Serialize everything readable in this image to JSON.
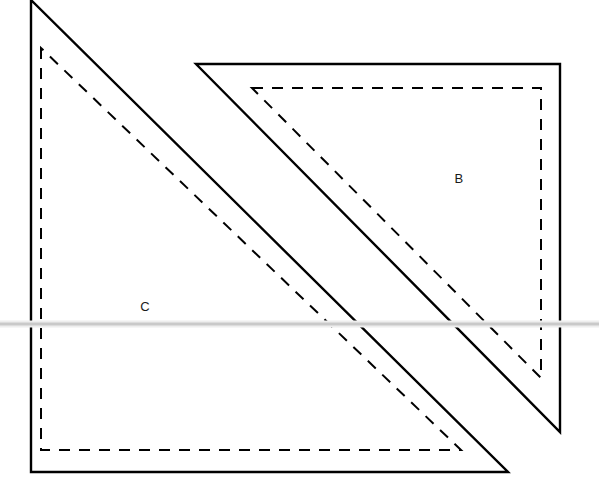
{
  "canvas": {
    "width": 599,
    "height": 478,
    "background": "#ffffff"
  },
  "style": {
    "solid_stroke": "#000000",
    "solid_width": 2.4,
    "dashed_stroke": "#000000",
    "dashed_width": 2.0,
    "dash_pattern": "11 9",
    "guide_color": "#c9c9c9",
    "guide_halo_color": "#eeeeee",
    "label_color": "#1a1a1a"
  },
  "shapes": [
    {
      "id": "shape-c",
      "label": "C",
      "label_x": 145,
      "label_y": 308,
      "solid_points": "31,0 31,472 508,472",
      "dashed_points": "41,48 41,450 461,450"
    },
    {
      "id": "shape-b",
      "label": "B",
      "label_x": 459,
      "label_y": 180,
      "solid_points": "196,64 560,64 560,432",
      "dashed_points": "252,88 541,88 541,378"
    }
  ],
  "guide_line": {
    "name": "horizontal-guide",
    "x1": 0,
    "y1": 324,
    "x2": 599,
    "y2": 324,
    "thickness": 3,
    "halo_thickness": 7
  },
  "chart_data": {
    "type": "diagram",
    "title": "",
    "labels": [
      "B",
      "C"
    ],
    "xlim": [
      0,
      599
    ],
    "ylim": [
      0,
      478
    ]
  }
}
